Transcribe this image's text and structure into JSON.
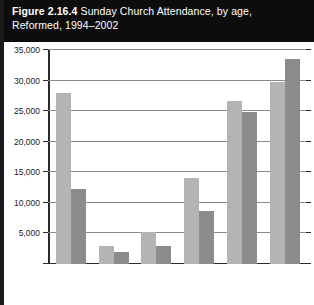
{
  "title": {
    "figure_label": "Figure",
    "figure_number": "2.16.4",
    "line1_rest": "Sunday Church Attendance, by age,",
    "line2": "Reformed, 1994–2002"
  },
  "legend": {
    "entries": [
      {
        "label": "1994",
        "color": "#b4b4b4"
      },
      {
        "label": "2002",
        "color": "#8c8c8c"
      }
    ]
  },
  "axis": {
    "y_ticks": [
      "35,000",
      "30,000",
      "25,000",
      "20,000",
      "15,000",
      "10,000",
      "5,000"
    ]
  },
  "chart_data": {
    "type": "bar",
    "title": "Figure 2.16.4 Sunday Church Attendance, by age, Reformed, 1994–2002",
    "xlabel": "",
    "ylabel": "",
    "ylim": [
      0,
      35000
    ],
    "ytick_values": [
      0,
      5000,
      10000,
      15000,
      20000,
      25000,
      30000,
      35000
    ],
    "grid": true,
    "legend_position": "bottom",
    "categories": [
      "Under 15",
      "15–19",
      "20–29",
      "30–44",
      "45–64",
      "65 and over"
    ],
    "series": [
      {
        "name": "1994",
        "color": "#b4b4b4",
        "values": [
          28000,
          3000,
          5200,
          14000,
          26700,
          29700
        ]
      },
      {
        "name": "2002",
        "color": "#8c8c8c",
        "values": [
          12200,
          1900,
          2900,
          8700,
          24800,
          33500
        ]
      }
    ]
  }
}
